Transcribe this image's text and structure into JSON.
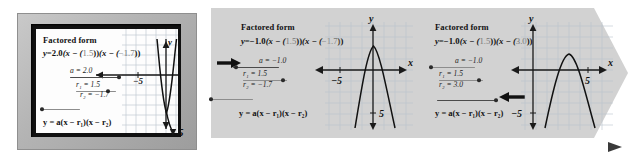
{
  "figure": {
    "type": "sequence-of-graphing-calculator-screens",
    "flow_arrow": "right-pointing-progression-arrow"
  },
  "panels": [
    {
      "id": "panel-1",
      "style": "calculator-screen-bezel",
      "heading": "Factored form",
      "equation": {
        "lhs": "y",
        "eq": "=",
        "a": "2.0",
        "factor1_prefix": "(x − (",
        "r1": "1.5",
        "factor1_suffix": "))",
        "factor2_prefix": "(x − (",
        "r2": "−1.7",
        "factor2_suffix": "))",
        "full": "y = 2.0(x − (1.5))(x − (−1.7))"
      },
      "sliders": [
        {
          "name": "a",
          "label": "a = 2.0",
          "var": "a",
          "sub": "",
          "value": "2.0",
          "knob_pct": 96,
          "highlight": false
        },
        {
          "name": "r1",
          "label": "r₁ = 1.5",
          "var": "r",
          "sub": "1",
          "value": "1.5",
          "knob_pct": 72,
          "highlight": false
        },
        {
          "name": "r2",
          "label": "r₂ = −1.7",
          "var": "r",
          "sub": "2",
          "value": "−1.7",
          "knob_pct": 2,
          "highlight": false
        }
      ],
      "general_form": "y = a(x − r₁)(x − r₂)",
      "graph": {
        "curve": "upward-narrow-parabola",
        "a": 2.0,
        "r1": 1.5,
        "r2": -1.7,
        "x_axis_label": "x",
        "y_axis_label": "y",
        "x_tick_label": "−5",
        "y_tick_label": "5",
        "grid": true
      },
      "cue_arrow": null
    },
    {
      "id": "panel-2",
      "style": "banner-panel",
      "heading": "Factored form",
      "equation": {
        "lhs": "y",
        "eq": "=",
        "a": "−1.0",
        "factor1_prefix": "(x − (",
        "r1": "1.5",
        "factor1_suffix": "))",
        "factor2_prefix": "(x − (",
        "r2": "−1.7",
        "factor2_suffix": "))",
        "full": "y = −1.0(x − (1.5))(x − (−1.7))"
      },
      "sliders": [
        {
          "name": "a",
          "label": "a = −1.0",
          "var": "a",
          "sub": "",
          "value": "−1.0",
          "knob_pct": 4,
          "highlight": true
        },
        {
          "name": "r1",
          "label": "r₁ = 1.5",
          "var": "r",
          "sub": "1",
          "value": "1.5",
          "knob_pct": 84,
          "highlight": false
        },
        {
          "name": "r2",
          "label": "r₂ = −1.7",
          "var": "r",
          "sub": "2",
          "value": "−1.7",
          "knob_pct": 2,
          "highlight": false
        }
      ],
      "general_form": "y = a(x − r₁)(x − r₂)",
      "graph": {
        "curve": "downward-parabola",
        "a": -1.0,
        "r1": 1.5,
        "r2": -1.7,
        "x_axis_label": "x",
        "y_axis_label": "y",
        "x_tick_label": "−5",
        "y_tick_label": "5",
        "grid": true
      },
      "cue_arrow": {
        "target": "a-slider",
        "direction": "right"
      }
    },
    {
      "id": "panel-3",
      "style": "banner-panel",
      "heading": "Factored form",
      "equation": {
        "lhs": "y",
        "eq": "=",
        "a": "−1.0",
        "factor1_prefix": "(x − (",
        "r1": "1.5",
        "factor1_suffix": "))",
        "factor2_prefix": "(x − (",
        "r2": "3.0",
        "factor2_suffix": "))",
        "full": "y = −1.0(x − (1.5))(x − (3.0))"
      },
      "sliders": [
        {
          "name": "a",
          "label": "a = −1.0",
          "var": "a",
          "sub": "",
          "value": "−1.0",
          "knob_pct": 4,
          "highlight": false
        },
        {
          "name": "r1",
          "label": "r₁ = 1.5",
          "var": "r",
          "sub": "1",
          "value": "1.5",
          "knob_pct": 84,
          "highlight": false
        },
        {
          "name": "r2",
          "label": "r₂ = 3.0",
          "var": "r",
          "sub": "2",
          "value": "3.0",
          "knob_pct": 97,
          "highlight": true
        }
      ],
      "general_form": "y = a(x − r₁)(x − r₂)",
      "graph": {
        "curve": "downward-parabola-shifted-right",
        "a": -1.0,
        "r1": 1.5,
        "r2": 3.0,
        "x_axis_label": "x",
        "y_axis_label": "y",
        "x_tick_label": "5",
        "y_tick_label": "−5",
        "grid": true
      },
      "cue_arrow": {
        "target": "r2-slider",
        "direction": "left"
      }
    }
  ],
  "colors": {
    "banner_fill": "#d2d2d2",
    "bezel": "#b8b8b8",
    "screen": "#fdfdfd",
    "grid": "#b9c4cf",
    "axis": "#1a1a1a",
    "curve": "#111111",
    "slider_track": "#8d8d8d",
    "slider_knob": "#2a2a2a",
    "value_text": "#777777"
  }
}
